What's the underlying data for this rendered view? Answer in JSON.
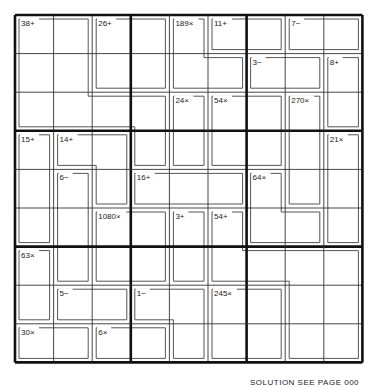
{
  "puzzle": {
    "type": "killer-kenken",
    "size": 9,
    "grid": {
      "left": 15,
      "top": 15,
      "cell": 38.6
    },
    "colors": {
      "cage_line": "#555555",
      "thin_line": "#333333",
      "thick_line": "#111111",
      "background": "#ffffff"
    },
    "cages": [
      {
        "label": "38+",
        "cells": [
          [
            0,
            0
          ],
          [
            0,
            1
          ],
          [
            1,
            0
          ],
          [
            1,
            1
          ],
          [
            2,
            0
          ],
          [
            2,
            1
          ],
          [
            2,
            2
          ],
          [
            2,
            3
          ],
          [
            3,
            3
          ]
        ]
      },
      {
        "label": "26+",
        "cells": [
          [
            0,
            2
          ],
          [
            0,
            3
          ],
          [
            1,
            2
          ],
          [
            1,
            3
          ]
        ]
      },
      {
        "label": "189×",
        "cells": [
          [
            0,
            4
          ],
          [
            1,
            4
          ],
          [
            1,
            5
          ]
        ]
      },
      {
        "label": "11+",
        "cells": [
          [
            0,
            5
          ],
          [
            0,
            6
          ]
        ]
      },
      {
        "label": "7−",
        "cells": [
          [
            0,
            7
          ],
          [
            0,
            8
          ]
        ]
      },
      {
        "label": "3−",
        "cells": [
          [
            1,
            6
          ],
          [
            1,
            7
          ]
        ]
      },
      {
        "label": "8+",
        "cells": [
          [
            1,
            8
          ],
          [
            2,
            8
          ]
        ]
      },
      {
        "label": "24×",
        "cells": [
          [
            2,
            4
          ],
          [
            3,
            4
          ]
        ]
      },
      {
        "label": "54×",
        "cells": [
          [
            2,
            5
          ],
          [
            2,
            6
          ],
          [
            3,
            5
          ],
          [
            3,
            6
          ]
        ]
      },
      {
        "label": "270×",
        "cells": [
          [
            2,
            7
          ],
          [
            3,
            7
          ],
          [
            4,
            7
          ]
        ]
      },
      {
        "label": "15+",
        "cells": [
          [
            3,
            0
          ],
          [
            4,
            0
          ],
          [
            5,
            0
          ]
        ]
      },
      {
        "label": "14+",
        "cells": [
          [
            3,
            1
          ],
          [
            3,
            2
          ],
          [
            4,
            2
          ]
        ]
      },
      {
        "label": "21×",
        "cells": [
          [
            3,
            8
          ],
          [
            4,
            8
          ],
          [
            5,
            8
          ]
        ]
      },
      {
        "label": "6−",
        "cells": [
          [
            4,
            1
          ],
          [
            5,
            1
          ],
          [
            6,
            1
          ]
        ]
      },
      {
        "label": "16+",
        "cells": [
          [
            4,
            3
          ],
          [
            4,
            4
          ],
          [
            4,
            5
          ]
        ]
      },
      {
        "label": "64×",
        "cells": [
          [
            4,
            6
          ],
          [
            5,
            6
          ],
          [
            5,
            7
          ]
        ]
      },
      {
        "label": "1080×",
        "cells": [
          [
            5,
            2
          ],
          [
            5,
            3
          ],
          [
            6,
            2
          ],
          [
            6,
            3
          ]
        ]
      },
      {
        "label": "3+",
        "cells": [
          [
            5,
            4
          ],
          [
            6,
            4
          ]
        ]
      },
      {
        "label": "54+",
        "cells": [
          [
            5,
            5
          ],
          [
            6,
            5
          ],
          [
            6,
            6
          ],
          [
            6,
            7
          ],
          [
            6,
            8
          ],
          [
            7,
            7
          ],
          [
            7,
            8
          ],
          [
            8,
            7
          ],
          [
            8,
            8
          ]
        ]
      },
      {
        "label": "63×",
        "cells": [
          [
            6,
            0
          ],
          [
            7,
            0
          ]
        ]
      },
      {
        "label": "5−",
        "cells": [
          [
            7,
            1
          ],
          [
            7,
            2
          ]
        ]
      },
      {
        "label": "1−",
        "cells": [
          [
            7,
            3
          ],
          [
            7,
            4
          ],
          [
            8,
            4
          ]
        ]
      },
      {
        "label": "245×",
        "cells": [
          [
            7,
            5
          ],
          [
            7,
            6
          ],
          [
            8,
            5
          ],
          [
            8,
            6
          ]
        ]
      },
      {
        "label": "30×",
        "cells": [
          [
            8,
            0
          ],
          [
            8,
            1
          ]
        ]
      },
      {
        "label": "6×",
        "cells": [
          [
            8,
            2
          ],
          [
            8,
            3
          ]
        ]
      }
    ]
  },
  "footer": {
    "text": "SOLUTION SEE PAGE 000"
  }
}
